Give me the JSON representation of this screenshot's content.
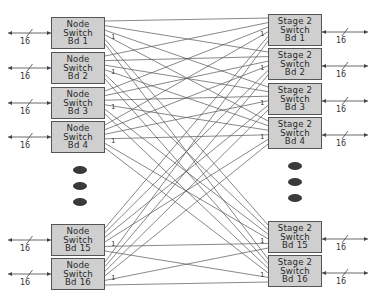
{
  "diagram": {
    "left_boards": [
      {
        "id": "node-1",
        "lines": [
          "Node",
          "Switch",
          "Bd 1"
        ]
      },
      {
        "id": "node-2",
        "lines": [
          "Node",
          "Switch",
          "Bd 2"
        ]
      },
      {
        "id": "node-3",
        "lines": [
          "Node",
          "Switch",
          "Bd 3"
        ]
      },
      {
        "id": "node-4",
        "lines": [
          "Node",
          "Switch",
          "Bd 4"
        ]
      },
      {
        "id": "node-15",
        "lines": [
          "Node",
          "Switch",
          "Bd 15"
        ]
      },
      {
        "id": "node-16",
        "lines": [
          "Node",
          "Switch",
          "Bd 16"
        ]
      }
    ],
    "right_boards": [
      {
        "id": "stage2-1",
        "lines": [
          "Stage 2",
          "Switch",
          "Bd 1"
        ]
      },
      {
        "id": "stage2-2",
        "lines": [
          "Stage 2",
          "Switch",
          "Bd 2"
        ]
      },
      {
        "id": "stage2-3",
        "lines": [
          "Stage 2",
          "Switch",
          "Bd 3"
        ]
      },
      {
        "id": "stage2-4",
        "lines": [
          "Stage 2",
          "Switch",
          "Bd 4"
        ]
      },
      {
        "id": "stage2-15",
        "lines": [
          "Stage 2",
          "Switch",
          "Bd 15"
        ]
      },
      {
        "id": "stage2-16",
        "lines": [
          "Stage 2",
          "Switch",
          "Bd 16"
        ]
      }
    ],
    "bus_width_label": "16",
    "link_label": "1",
    "ellipsis_dots": 3,
    "topology": "full-mesh",
    "colors": {
      "box_fill": "#cfcfcf",
      "line": "#555555",
      "dot": "#3a3a3a"
    }
  }
}
